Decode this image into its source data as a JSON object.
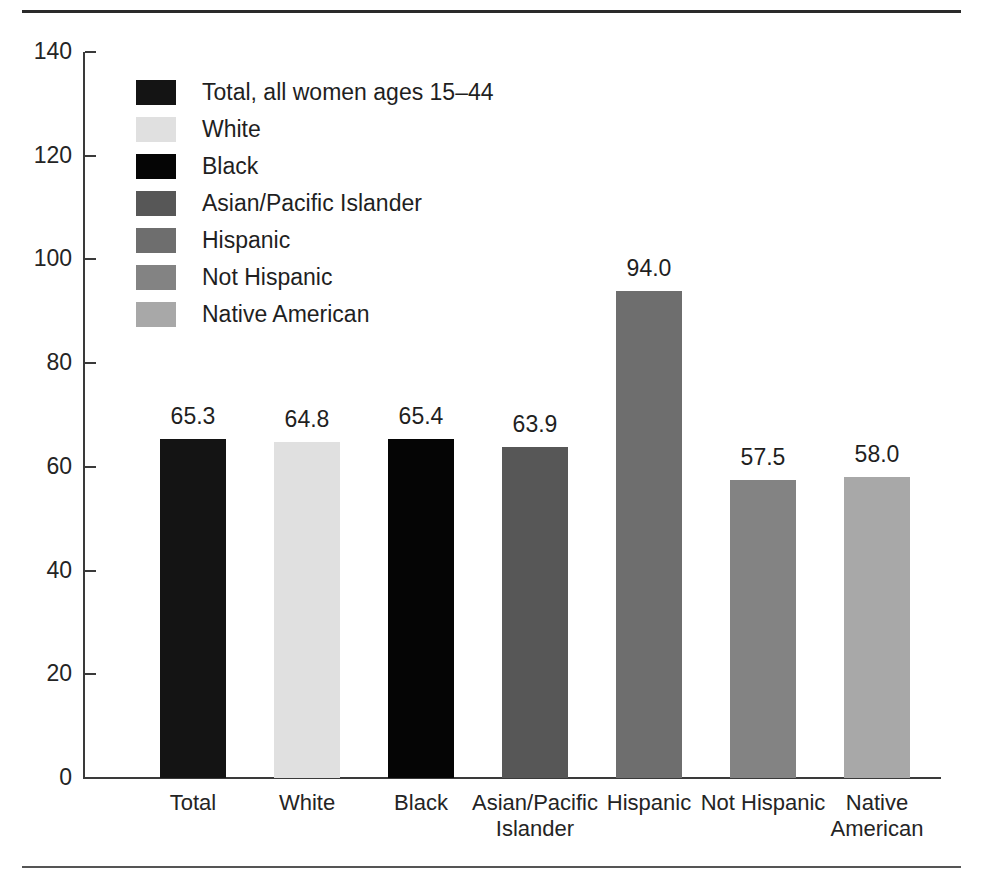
{
  "chart_data": {
    "type": "bar",
    "title": "",
    "subtitle": "",
    "xlabel": "",
    "ylabel": "",
    "ylim": [
      0,
      140
    ],
    "ytick_step": 20,
    "yticks": [
      "140",
      "120",
      "100",
      "80",
      "60",
      "40",
      "20",
      "0"
    ],
    "grid": false,
    "legend_position": "inside-top-left",
    "categories": [
      "Total",
      "White",
      "Black",
      "Asian/Pacific Islander",
      "Hispanic",
      "Not Hispanic",
      "Native American"
    ],
    "category_tick_labels": [
      "Total",
      "White",
      "Black",
      "Asian/Pacific\nIslander",
      "Hispanic",
      "Not Hispanic",
      "Native\nAmerican"
    ],
    "values": [
      65.3,
      64.8,
      65.4,
      63.9,
      94.0,
      57.5,
      58.0
    ],
    "value_labels": [
      "65.3",
      "64.8",
      "65.4",
      "63.9",
      "94.0",
      "57.5",
      "58.0"
    ],
    "colors": [
      "#141414",
      "#e0e0e0",
      "#050505",
      "#575757",
      "#6e6e6e",
      "#838383",
      "#a8a8a8"
    ],
    "legend": [
      {
        "label": "Total, all women ages 15–44",
        "color": "#141414"
      },
      {
        "label": "White",
        "color": "#e0e0e0"
      },
      {
        "label": "Black",
        "color": "#050505"
      },
      {
        "label": "Asian/Pacific Islander",
        "color": "#575757"
      },
      {
        "label": "Hispanic",
        "color": "#6e6e6e"
      },
      {
        "label": "Not Hispanic",
        "color": "#838383"
      },
      {
        "label": "Native American",
        "color": "#a8a8a8"
      }
    ]
  },
  "figure": {
    "axis_color": "#3a3a3a",
    "rule_color": "#2a2a2a"
  }
}
